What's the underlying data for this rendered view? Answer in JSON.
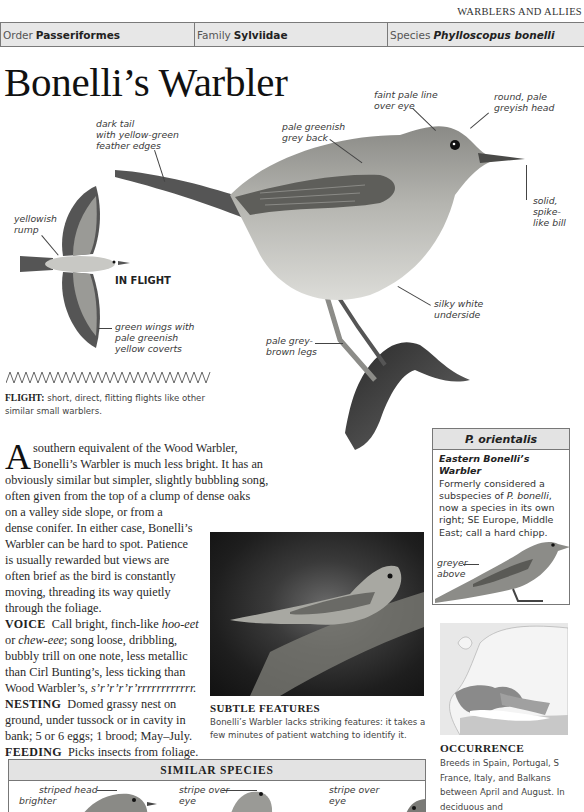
{
  "running_head": "WARBLERS AND ALLIES",
  "taxonomy": {
    "order_label": "Order",
    "order_value": "Passeriformes",
    "family_label": "Family",
    "family_value": "Sylviidae",
    "species_label": "Species",
    "species_value": "Phylloscopus bonelli"
  },
  "title": "Bonelli’s Warbler",
  "annotations": {
    "dark_tail": [
      "dark tail",
      "with yellow-green",
      "feather edges"
    ],
    "back": [
      "pale greenish",
      "grey back"
    ],
    "eye_line": [
      "faint pale line",
      "over eye"
    ],
    "head": [
      "round, pale",
      "greyish head"
    ],
    "bill": [
      "solid,",
      "spike-",
      "like bill"
    ],
    "underside": [
      "silky white",
      "underside"
    ],
    "legs": [
      "pale grey-",
      "brown legs"
    ],
    "rump": [
      "yellowish",
      "rump"
    ],
    "wings": [
      "green wings with",
      "pale greenish",
      "yellow coverts"
    ]
  },
  "in_flight_label": "IN FLIGHT",
  "flight": {
    "label": "FLIGHT:",
    "text": "short, direct, flitting flights like other similar small warblers."
  },
  "body": {
    "dropcap": "A",
    "intro_lines": [
      "southern equivalent of the Wood Warbler,",
      "Bonelli’s Warbler is much less bright. It has an",
      "obviously similar but simpler, slightly bubbling song,",
      "often given from the top of a clump of dense oaks",
      "on a valley side slope, or from a",
      "dense conifer. In either case, Bonelli’s",
      "Warbler can be hard to spot. Patience",
      "is usually rewarded but views are",
      "often brief as the bird is constantly",
      "moving, threading its way quietly",
      "through the foliage."
    ],
    "voice_label": "VOICE",
    "voice_lines": [
      "Call bright, finch-like ",
      "or ",
      "bubbly trill on one note, less metallic",
      "than Cirl Bunting’s, less ticking than",
      "Wood Warbler’s, "
    ],
    "voice_call_1": "hoo-eet",
    "voice_call_2": "chew-eee",
    "voice_after_call_2": "; song loose, dribbling,",
    "voice_song": "s’r’r’r’r’rrrrrrrrrrrr.",
    "nesting_label": "NESTING",
    "nesting_lines": [
      "Domed grassy nest on",
      "ground, under tussock or in cavity in",
      "bank; 5 or 6 eggs; 1 brood; May–July."
    ],
    "feeding_label": "FEEDING",
    "feeding_text": "Picks insects from foliage."
  },
  "photo_caption": {
    "heading": "SUBTLE FEATURES",
    "text": "Bonelli’s Warbler lacks striking features: it takes a few minutes of patient watching to identify it."
  },
  "sidebox": {
    "heading": "P. orientalis",
    "subtitle": "Eastern Bonelli’s Warbler",
    "text_1": "Formerly considered a subspecies of ",
    "text_em": "P. bonelli",
    "text_2": ", now a species in its own right; SE Europe, Middle East; call a hard chipp.",
    "annotation": [
      "greyer",
      "above"
    ]
  },
  "occurrence": {
    "heading": "OCCURRENCE",
    "text": "Breeds in Spain, Portugal, S France, Italy, and Balkans between April and August. In deciduous and"
  },
  "similar_species": {
    "heading": "SIMILAR SPECIES",
    "annotations": [
      "striped head",
      "brighter",
      "stripe over",
      "eye",
      "stripe over",
      "eye"
    ]
  }
}
